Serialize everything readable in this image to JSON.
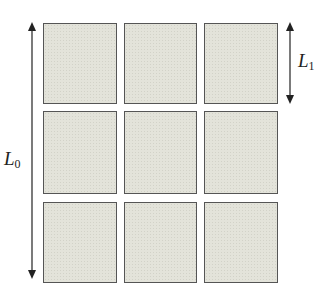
{
  "diagram": {
    "type": "grid",
    "rows": 3,
    "cols": 3,
    "fill_color": "#e3e3da",
    "border_color": "#555555",
    "cells": [
      {
        "row": 1,
        "col": 1,
        "x": 43,
        "y": 23,
        "w": 74,
        "h": 81
      },
      {
        "row": 1,
        "col": 2,
        "x": 124,
        "y": 23,
        "w": 73,
        "h": 81
      },
      {
        "row": 1,
        "col": 3,
        "x": 204,
        "y": 23,
        "w": 74,
        "h": 81
      },
      {
        "row": 2,
        "col": 1,
        "x": 43,
        "y": 111,
        "w": 74,
        "h": 83
      },
      {
        "row": 2,
        "col": 2,
        "x": 124,
        "y": 111,
        "w": 73,
        "h": 83
      },
      {
        "row": 2,
        "col": 3,
        "x": 204,
        "y": 111,
        "w": 74,
        "h": 83
      },
      {
        "row": 3,
        "col": 1,
        "x": 43,
        "y": 202,
        "w": 74,
        "h": 81
      },
      {
        "row": 3,
        "col": 2,
        "x": 124,
        "y": 202,
        "w": 73,
        "h": 81
      },
      {
        "row": 3,
        "col": 3,
        "x": 204,
        "y": 202,
        "w": 74,
        "h": 81
      }
    ],
    "dimensions": [
      {
        "name": "L0",
        "main": "L",
        "sub": "0",
        "spans": "full grid height"
      },
      {
        "name": "L1",
        "main": "L",
        "sub": "1",
        "spans": "single cell height"
      }
    ]
  }
}
